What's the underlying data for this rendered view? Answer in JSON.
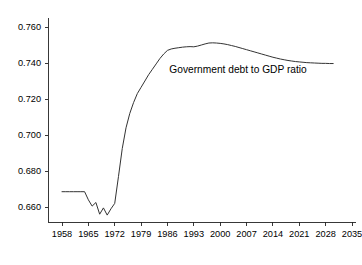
{
  "chart_data": {
    "type": "line",
    "title": "",
    "subtitle": "",
    "xlabel": "",
    "ylabel": "",
    "grid": false,
    "legend_position": "none",
    "xlim": [
      1958,
      2035
    ],
    "ylim": [
      0.6525,
      0.7655
    ],
    "xticks": [
      1958,
      1965,
      1972,
      1979,
      1986,
      1993,
      2000,
      2007,
      2014,
      2021,
      2028,
      2035
    ],
    "xtick_labels": [
      "1958",
      "1965",
      "1972",
      "1979",
      "1986",
      "1993",
      "2000",
      "2007",
      "2014",
      "2021",
      "2028",
      "2035"
    ],
    "yticks": [
      0.66,
      0.68,
      0.7,
      0.72,
      0.74,
      0.76
    ],
    "ytick_labels": [
      "0.660",
      "0.680",
      "0.700",
      "0.720",
      "0.740",
      "0.760"
    ],
    "annotations": [
      {
        "name": "series-label",
        "text": "Government debt to GDP ratio",
        "x": 1986.5,
        "y": 0.7345
      }
    ],
    "series": [
      {
        "name": "Government debt to GDP ratio",
        "color": "#333333",
        "x": [
          1958,
          1959,
          1960,
          1961,
          1962,
          1963,
          1964,
          1965,
          1966,
          1967,
          1968,
          1969,
          1970,
          1971,
          1972,
          1973,
          1974,
          1975,
          1976,
          1977,
          1978,
          1979,
          1980,
          1981,
          1982,
          1983,
          1984,
          1985,
          1986,
          1987,
          1988,
          1989,
          1990,
          1991,
          1992,
          1993,
          1994,
          1995,
          1996,
          1997,
          1998,
          1999,
          2000,
          2001,
          2002,
          2003,
          2004,
          2005,
          2006,
          2007,
          2008,
          2009,
          2010,
          2011,
          2012,
          2013,
          2014,
          2015,
          2016,
          2017,
          2018,
          2019,
          2020,
          2021,
          2022,
          2023,
          2024,
          2025,
          2026,
          2027,
          2028,
          2029,
          2030
        ],
        "y": [
          0.6685,
          0.6685,
          0.6685,
          0.6685,
          0.6685,
          0.6685,
          0.6685,
          0.664,
          0.6605,
          0.6625,
          0.656,
          0.6595,
          0.6555,
          0.659,
          0.662,
          0.677,
          0.6925,
          0.704,
          0.712,
          0.718,
          0.723,
          0.7265,
          0.73,
          0.7335,
          0.7365,
          0.7395,
          0.7425,
          0.745,
          0.747,
          0.7478,
          0.7482,
          0.7485,
          0.7488,
          0.749,
          0.7491,
          0.749,
          0.7494,
          0.75,
          0.7506,
          0.7511,
          0.7512,
          0.7511,
          0.7509,
          0.7506,
          0.7502,
          0.7497,
          0.7492,
          0.7486,
          0.748,
          0.7474,
          0.7468,
          0.7462,
          0.7456,
          0.745,
          0.7444,
          0.7438,
          0.7432,
          0.7427,
          0.7422,
          0.7418,
          0.7414,
          0.7411,
          0.7408,
          0.7406,
          0.7404,
          0.7402,
          0.7401,
          0.74,
          0.7399,
          0.7398,
          0.7398,
          0.7397,
          0.7397
        ]
      }
    ]
  },
  "colors": {
    "line": "#333333",
    "axis": "#222222",
    "background": "#ffffff",
    "text": "#000000"
  }
}
